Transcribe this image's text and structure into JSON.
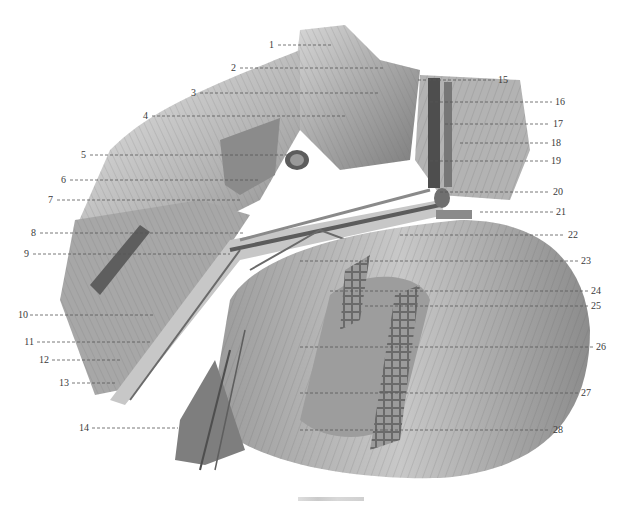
{
  "figure": {
    "type": "anatomical-illustration",
    "style": "grayscale pencil/engraving",
    "caption": "",
    "caption_note": "caption text at bottom is present but illegible"
  },
  "labels": {
    "left": [
      {
        "n": "1",
        "y": 45
      },
      {
        "n": "2",
        "y": 68
      },
      {
        "n": "3",
        "y": 93
      },
      {
        "n": "4",
        "y": 116
      },
      {
        "n": "5",
        "y": 155
      },
      {
        "n": "6",
        "y": 180
      },
      {
        "n": "7",
        "y": 200
      },
      {
        "n": "8",
        "y": 233
      },
      {
        "n": "9",
        "y": 254
      },
      {
        "n": "10",
        "y": 315
      },
      {
        "n": "11",
        "y": 342
      },
      {
        "n": "12",
        "y": 360
      },
      {
        "n": "13",
        "y": 383
      },
      {
        "n": "14",
        "y": 428
      }
    ],
    "right": [
      {
        "n": "15",
        "y": 80
      },
      {
        "n": "16",
        "y": 102
      },
      {
        "n": "17",
        "y": 124
      },
      {
        "n": "18",
        "y": 143
      },
      {
        "n": "19",
        "y": 161
      },
      {
        "n": "20",
        "y": 192
      },
      {
        "n": "21",
        "y": 212
      },
      {
        "n": "22",
        "y": 235
      },
      {
        "n": "23",
        "y": 261
      },
      {
        "n": "24",
        "y": 291
      },
      {
        "n": "25",
        "y": 306
      },
      {
        "n": "26",
        "y": 347
      },
      {
        "n": "27",
        "y": 393
      },
      {
        "n": "28",
        "y": 430
      }
    ]
  },
  "colors": {
    "background": "#ffffff",
    "label_text": "#3a3a3a",
    "leader_line": "#555555"
  }
}
